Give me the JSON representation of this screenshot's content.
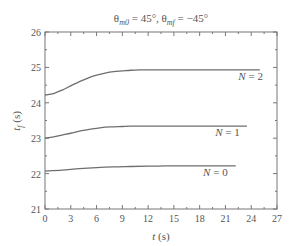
{
  "chart_data": {
    "type": "line",
    "title": "θm0 = 45°, θmf = −45°",
    "title_parts": {
      "theta": "θ",
      "sub1": "m0",
      "mid": " = 45°, ",
      "sub2": "mf",
      "end": " = −45°"
    },
    "xlabel": "t (s)",
    "ylabel": "tf (s)",
    "xlim": [
      0,
      27
    ],
    "ylim": [
      21,
      26
    ],
    "xticks": [
      0,
      3,
      6,
      9,
      12,
      15,
      18,
      21,
      24,
      27
    ],
    "yticks": [
      21,
      22,
      23,
      24,
      25,
      26
    ],
    "grid": false,
    "legend": "inline labels",
    "series": [
      {
        "name": "N = 2",
        "x": [
          0,
          1,
          2,
          3,
          4,
          5,
          6,
          7,
          8,
          9,
          10,
          11,
          12,
          14,
          16,
          18,
          20,
          22,
          25
        ],
        "values": [
          24.22,
          24.26,
          24.36,
          24.48,
          24.6,
          24.7,
          24.78,
          24.84,
          24.88,
          24.9,
          24.92,
          24.93,
          24.93,
          24.93,
          24.93,
          24.93,
          24.93,
          24.93,
          24.93
        ]
      },
      {
        "name": "N = 1",
        "x": [
          0,
          1,
          2,
          3,
          4,
          5,
          6,
          7,
          8,
          9,
          10,
          12,
          14,
          16,
          18,
          20,
          23.5
        ],
        "values": [
          23.0,
          23.04,
          23.09,
          23.14,
          23.2,
          23.24,
          23.28,
          23.31,
          23.32,
          23.33,
          23.34,
          23.34,
          23.34,
          23.34,
          23.34,
          23.34,
          23.34
        ]
      },
      {
        "name": "N = 0",
        "x": [
          0,
          2,
          4,
          6,
          8,
          10,
          12,
          14,
          16,
          18,
          20,
          22.2
        ],
        "values": [
          22.07,
          22.1,
          22.14,
          22.17,
          22.19,
          22.2,
          22.21,
          22.22,
          22.22,
          22.22,
          22.22,
          22.22
        ]
      }
    ],
    "annotations": [
      {
        "text": "N = 2",
        "x": 22.5,
        "y": 24.65
      },
      {
        "text": "N = 1",
        "x": 19.8,
        "y": 23.07
      },
      {
        "text": "N = 0",
        "x": 18.4,
        "y": 21.92
      }
    ]
  },
  "layout": {
    "plot": {
      "left": 45,
      "top": 32,
      "right": 277,
      "bottom": 209
    },
    "line_color": "#6e6e6e",
    "axis_color": "#777777"
  }
}
